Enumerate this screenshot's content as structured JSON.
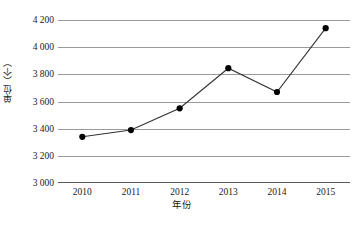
{
  "chart_data": {
    "type": "line",
    "title": "",
    "subtitle": "",
    "xlabel": "年份",
    "ylabel": "单位（个）",
    "categories": [
      "2010",
      "2011",
      "2012",
      "2013",
      "2014",
      "2015"
    ],
    "x": [
      2010,
      2011,
      2012,
      2013,
      2014,
      2015
    ],
    "values": [
      3340,
      3390,
      3550,
      3845,
      3670,
      4140
    ],
    "series": [
      {
        "name": "单位（个）",
        "values": [
          3340,
          3390,
          3550,
          3845,
          3670,
          4140
        ]
      }
    ],
    "ylim": [
      3000,
      4200
    ],
    "yticks": [
      3000,
      3200,
      3400,
      3600,
      3800,
      4000,
      4200
    ],
    "ytick_labels": [
      "3 000",
      "3 200",
      "3 400",
      "3 600",
      "3 800",
      "4 000",
      "4 200"
    ],
    "xtick_labels": [
      "2010",
      "2011",
      "2012",
      "2013",
      "2014",
      "2015"
    ],
    "grid": true,
    "grid_axis": "y",
    "legend": false,
    "legend_position": "none",
    "marker": "circle",
    "line_color": "#333333",
    "marker_color": "#000000",
    "grid_color": "#9a9a9a",
    "background_color": "#ffffff",
    "annotations": []
  }
}
